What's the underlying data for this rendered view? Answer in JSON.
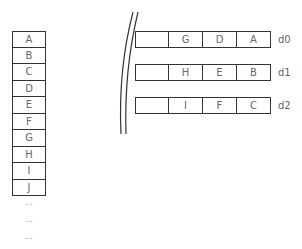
{
  "array": {
    "cells": [
      "A",
      "B",
      "C",
      "D",
      "E",
      "F",
      "G",
      "H",
      "I",
      "J"
    ],
    "ellipsis": [
      "...",
      "...",
      "..."
    ]
  },
  "devices": [
    {
      "label": "d0",
      "cells": [
        "",
        "G",
        "D",
        "A"
      ]
    },
    {
      "label": "d1",
      "cells": [
        "",
        "H",
        "E",
        "B"
      ]
    },
    {
      "label": "d2",
      "cells": [
        "",
        "I",
        "F",
        "C"
      ]
    }
  ],
  "colors": {
    "stroke": "#333333",
    "text": "#666666"
  }
}
